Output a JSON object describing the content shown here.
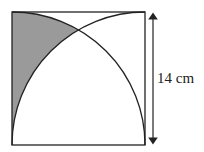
{
  "diagram": {
    "type": "geometry",
    "dimension_label": "14 cm",
    "colors": {
      "stroke": "#222222",
      "shade": "#9a9a9a",
      "background": "#ffffff"
    }
  }
}
